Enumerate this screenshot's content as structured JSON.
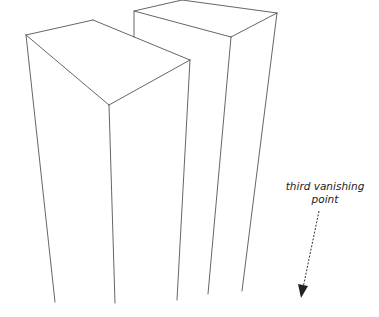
{
  "diagram": {
    "type": "three-point-perspective sketch",
    "annotation": {
      "line1": "third vanishing",
      "line2": "point"
    },
    "colors": {
      "line": "#555555",
      "text": "#222222",
      "background": "#ffffff"
    },
    "shapes": [
      {
        "name": "left-box",
        "description": "tall rectangular prism, top face visible"
      },
      {
        "name": "right-box",
        "description": "taller rectangular prism behind, top face visible"
      }
    ]
  }
}
